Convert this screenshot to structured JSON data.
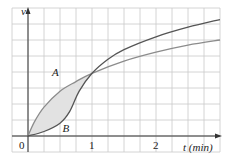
{
  "chart_data": {
    "type": "line",
    "title": "",
    "xlabel": "t (min)",
    "ylabel": "v",
    "xlim": [
      -0.25,
      3.0
    ],
    "ylim": [
      -0.25,
      2.0
    ],
    "x_ticks": [
      {
        "value": 0,
        "label": "0"
      },
      {
        "value": 1,
        "label": "1"
      },
      {
        "value": 2,
        "label": "2"
      }
    ],
    "grid": true,
    "grid_step": {
      "x": 0.25,
      "y": 0.25
    },
    "shaded_region": {
      "between": [
        "A",
        "B"
      ],
      "x_range": [
        0,
        1
      ],
      "color": "#e2e2e2"
    },
    "series": [
      {
        "name": "A",
        "color": "#8c8c8c",
        "x": [
          0,
          0.1,
          0.25,
          0.5,
          0.75,
          1.0,
          1.5,
          2.0,
          2.5,
          3.0
        ],
        "y": [
          0,
          0.22,
          0.45,
          0.7,
          0.85,
          0.98,
          1.17,
          1.31,
          1.42,
          1.5
        ]
      },
      {
        "name": "B",
        "color": "#555555",
        "x": [
          0,
          0.25,
          0.5,
          0.65,
          0.8,
          1.0,
          1.25,
          1.5,
          2.0,
          2.5,
          3.0
        ],
        "y": [
          0,
          0.07,
          0.2,
          0.38,
          0.7,
          0.98,
          1.2,
          1.35,
          1.55,
          1.7,
          1.82
        ]
      }
    ],
    "annotations": [
      {
        "text": "A",
        "x": 0.5,
        "y": 0.98
      },
      {
        "text": "B",
        "x": 0.65,
        "y": 0.1
      }
    ]
  }
}
